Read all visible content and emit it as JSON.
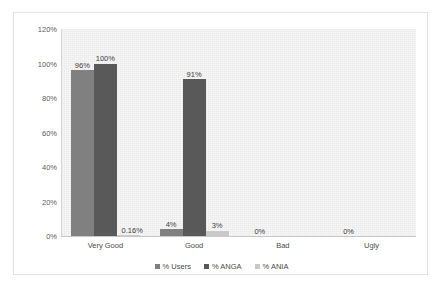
{
  "chart_data": {
    "type": "bar",
    "title": "",
    "subtitle": "",
    "xlabel": "",
    "ylabel": "",
    "categories": [
      "Very Good",
      "Good",
      "Bad",
      "Ugly"
    ],
    "series": [
      {
        "name": "% Users",
        "color": "#808080",
        "values": [
          96,
          4,
          0,
          0
        ],
        "labels": [
          "96%",
          "4%",
          "0%",
          "0%"
        ]
      },
      {
        "name": "% ANGA",
        "color": "#595959",
        "values": [
          100,
          91,
          0,
          0
        ],
        "labels": [
          "100%",
          "91%",
          "",
          ""
        ]
      },
      {
        "name": "% ANIA",
        "color": "#c9c9c9",
        "values": [
          0.16,
          3,
          0,
          0
        ],
        "labels": [
          "0.16%",
          "3%",
          "",
          ""
        ]
      }
    ],
    "ylim": [
      0,
      120
    ],
    "ytick_labels": [
      "0%",
      "20%",
      "40%",
      "60%",
      "80%",
      "100%",
      "120%"
    ],
    "ytick_values": [
      0,
      20,
      40,
      60,
      80,
      100,
      120
    ],
    "grid": false,
    "legend_position": "bottom",
    "plot_background": "#f7f7f7",
    "frame_border_color": "#e2e2e2"
  }
}
